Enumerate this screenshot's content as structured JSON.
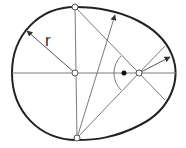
{
  "diagram": {
    "colors": {
      "curve": "#222222",
      "construction_lines": "#7a7a7a",
      "point_fill_open": "#ffffff",
      "point_fill_solid": "#111111",
      "background": "#ffffff"
    },
    "labels": {
      "radius": "r"
    },
    "points": {
      "top": {
        "x": 75,
        "y": 7,
        "style": "open"
      },
      "bottom": {
        "x": 77,
        "y": 138,
        "style": "open"
      },
      "center": {
        "x": 75,
        "y": 73,
        "style": "open"
      },
      "right_center": {
        "x": 139,
        "y": 73,
        "style": "open"
      },
      "focus_dot": {
        "x": 124,
        "y": 73,
        "style": "filled"
      }
    }
  }
}
